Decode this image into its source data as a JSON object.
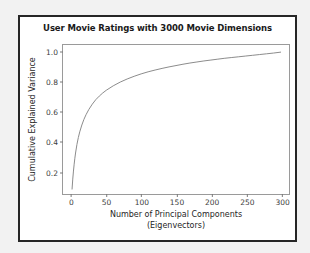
{
  "figure": {
    "background": "#ffffff",
    "page_background": "#f2f2f2",
    "border_color": "#262626"
  },
  "chart_data": {
    "type": "line",
    "title": "User Movie Ratings with 3000 Movie Dimensions",
    "xlabel_line1": "Number of Principal Components",
    "xlabel_line2": "(Eigenvectors)",
    "ylabel": "Cumulative Explained Variance",
    "grid": false,
    "legend": null,
    "line_color": "#8c8c8c",
    "line_width": 1,
    "xlim": [
      -12,
      312
    ],
    "ylim": [
      0.045,
      1.045
    ],
    "xticks": [
      0,
      50,
      100,
      150,
      200,
      250,
      300
    ],
    "xtick_labels": [
      "0",
      "50",
      "100",
      "150",
      "200",
      "250",
      "300"
    ],
    "yticks": [
      0.2,
      0.4,
      0.6,
      0.8,
      1.0
    ],
    "ytick_labels": [
      "0.2",
      "0.4",
      "0.6",
      "0.8",
      "1.0"
    ],
    "series": [
      {
        "name": "Cumulative explained variance",
        "x": [
          1,
          2,
          3,
          4,
          5,
          6,
          8,
          10,
          12,
          15,
          18,
          21,
          25,
          30,
          35,
          40,
          45,
          50,
          60,
          70,
          80,
          90,
          100,
          110,
          120,
          130,
          140,
          150,
          160,
          170,
          180,
          190,
          200,
          210,
          220,
          230,
          240,
          250,
          260,
          270,
          280,
          290,
          300
        ],
        "y": [
          0.078,
          0.145,
          0.199,
          0.245,
          0.285,
          0.32,
          0.378,
          0.424,
          0.462,
          0.508,
          0.546,
          0.577,
          0.612,
          0.648,
          0.678,
          0.702,
          0.723,
          0.741,
          0.771,
          0.796,
          0.817,
          0.835,
          0.851,
          0.865,
          0.877,
          0.888,
          0.898,
          0.907,
          0.916,
          0.924,
          0.931,
          0.938,
          0.944,
          0.95,
          0.956,
          0.961,
          0.966,
          0.971,
          0.976,
          0.981,
          0.986,
          0.991,
          0.997
        ]
      }
    ]
  }
}
